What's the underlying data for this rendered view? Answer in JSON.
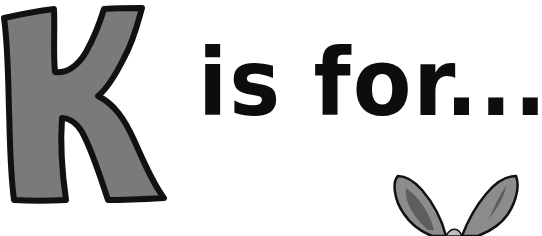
{
  "letter": "K",
  "tagline": "is for...",
  "illustration": "kangaroo-ears",
  "colors": {
    "letter_fill": "#7a7a7a",
    "outline": "#111111",
    "text": "#0d0d0d",
    "ear_outer": "#8c8c8c",
    "ear_inner": "#5e5e5e",
    "background": "#ffffff"
  }
}
